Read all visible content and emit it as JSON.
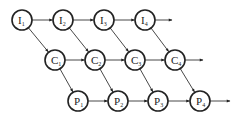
{
  "diagram": {
    "type": "pipeline-dependency-graph",
    "rows": [
      {
        "id": "I",
        "label": "I",
        "y": 20,
        "nodes": [
          {
            "id": "I1",
            "base": "I",
            "sub": "1",
            "x": 22
          },
          {
            "id": "I2",
            "base": "I",
            "sub": "2",
            "x": 63
          },
          {
            "id": "I3",
            "base": "I",
            "sub": "3",
            "x": 104
          },
          {
            "id": "I4",
            "base": "I",
            "sub": "4",
            "x": 145
          }
        ],
        "tail_arrow_end_x": 172
      },
      {
        "id": "C",
        "label": "C",
        "y": 60,
        "nodes": [
          {
            "id": "C1",
            "base": "C",
            "sub": "1",
            "x": 55
          },
          {
            "id": "C2",
            "base": "C",
            "sub": "2",
            "x": 95
          },
          {
            "id": "C3",
            "base": "C",
            "sub": "3",
            "x": 135
          },
          {
            "id": "C4",
            "base": "C",
            "sub": "4",
            "x": 175
          }
        ],
        "tail_arrow_end_x": 203
      },
      {
        "id": "P",
        "label": "P",
        "y": 101,
        "nodes": [
          {
            "id": "P1",
            "base": "P",
            "sub": "1",
            "x": 78
          },
          {
            "id": "P2",
            "base": "P",
            "sub": "2",
            "x": 118
          },
          {
            "id": "P3",
            "base": "P",
            "sub": "3",
            "x": 158
          },
          {
            "id": "P4",
            "base": "P",
            "sub": "4",
            "x": 200
          }
        ],
        "tail_arrow_end_x": 230
      }
    ],
    "edges": [
      [
        "I1",
        "I2"
      ],
      [
        "I2",
        "I3"
      ],
      [
        "I3",
        "I4"
      ],
      [
        "C1",
        "C2"
      ],
      [
        "C2",
        "C3"
      ],
      [
        "C3",
        "C4"
      ],
      [
        "P1",
        "P2"
      ],
      [
        "P2",
        "P3"
      ],
      [
        "P3",
        "P4"
      ],
      [
        "I1",
        "C1"
      ],
      [
        "I2",
        "C2"
      ],
      [
        "I3",
        "C3"
      ],
      [
        "I4",
        "C4"
      ],
      [
        "C1",
        "P1"
      ],
      [
        "C2",
        "P2"
      ],
      [
        "C3",
        "P3"
      ],
      [
        "C4",
        "P4"
      ]
    ],
    "node_radius": 10,
    "colors": {
      "stroke": "#222222",
      "fill": "#ffffff",
      "edge": "#333333"
    }
  }
}
